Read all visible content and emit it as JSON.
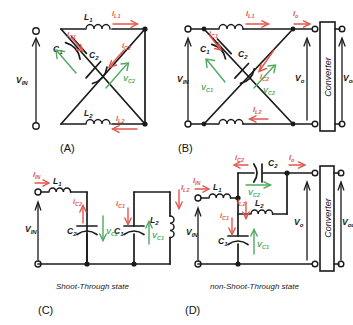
{
  "figure": {
    "panels": [
      {
        "id": "A",
        "label": "(A)",
        "source_label": "V",
        "source_sub": "IN",
        "components": [
          {
            "name": "L1",
            "base": "L",
            "sub": "1"
          },
          {
            "name": "L2",
            "base": "L",
            "sub": "2"
          },
          {
            "name": "C1",
            "base": "C",
            "sub": "1"
          },
          {
            "name": "C2",
            "base": "C",
            "sub": "2"
          }
        ],
        "currents": [
          {
            "base": "I",
            "sub": "L1"
          },
          {
            "base": "I",
            "sub": "L2"
          },
          {
            "base": "i",
            "sub": "C1"
          },
          {
            "base": "i",
            "sub": "C2"
          }
        ],
        "voltages": [
          {
            "base": "V",
            "sub": "C2"
          }
        ]
      },
      {
        "id": "B",
        "label": "(B)",
        "source_label": "V",
        "source_sub": "IN",
        "converter_label": "Converter",
        "components": [
          {
            "name": "L1",
            "base": "L",
            "sub": "1"
          },
          {
            "name": "L2",
            "base": "L",
            "sub": "2"
          },
          {
            "name": "C1",
            "base": "C",
            "sub": "1"
          },
          {
            "name": "C2",
            "base": "C",
            "sub": "2"
          }
        ],
        "currents": [
          {
            "base": "I",
            "sub": "L1"
          },
          {
            "base": "I",
            "sub": "L2"
          },
          {
            "base": "i",
            "sub": "C1"
          },
          {
            "base": "i",
            "sub": "C2"
          },
          {
            "base": "I",
            "sub": "o"
          }
        ],
        "voltages": [
          {
            "base": "V",
            "sub": "C1"
          },
          {
            "base": "V",
            "sub": "C2"
          },
          {
            "base": "V",
            "sub": "o"
          },
          {
            "base": "V",
            "sub": "out"
          }
        ]
      },
      {
        "id": "C",
        "label": "(C)",
        "state": "Shoot-Through state",
        "source_label": "V",
        "source_sub": "IN",
        "components": [
          {
            "name": "L1",
            "base": "L",
            "sub": "1"
          },
          {
            "name": "L2",
            "base": "L",
            "sub": "2"
          },
          {
            "name": "C1",
            "base": "C",
            "sub": "1"
          },
          {
            "name": "C2",
            "base": "C",
            "sub": "2"
          }
        ],
        "currents": [
          {
            "base": "I",
            "sub": "IN"
          },
          {
            "base": "I",
            "sub": "L2"
          },
          {
            "base": "i",
            "sub": "C1"
          },
          {
            "base": "i",
            "sub": "C2"
          }
        ],
        "voltages": [
          {
            "base": "V",
            "sub": "C1"
          },
          {
            "base": "V",
            "sub": "C2"
          }
        ]
      },
      {
        "id": "D",
        "label": "(D)",
        "state": "non-Shoot-Through state",
        "source_label": "V",
        "source_sub": "IN",
        "converter_label": "Converter",
        "components": [
          {
            "name": "L1",
            "base": "L",
            "sub": "1"
          },
          {
            "name": "L2",
            "base": "L",
            "sub": "2"
          },
          {
            "name": "C1",
            "base": "C",
            "sub": "1"
          },
          {
            "name": "C2",
            "base": "C",
            "sub": "2"
          }
        ],
        "currents": [
          {
            "base": "I",
            "sub": "IN"
          },
          {
            "base": "I",
            "sub": "L2"
          },
          {
            "base": "i",
            "sub": "C1"
          },
          {
            "base": "i",
            "sub": "C2"
          },
          {
            "base": "I",
            "sub": "o"
          }
        ],
        "voltages": [
          {
            "base": "V",
            "sub": "C1"
          },
          {
            "base": "V",
            "sub": "C2"
          },
          {
            "base": "V",
            "sub": "o"
          },
          {
            "base": "V",
            "sub": "out"
          }
        ]
      }
    ],
    "colors": {
      "wire": "#1a1a1a",
      "current_arrow": "#e2574c",
      "voltage_arrow": "#4ea961",
      "background": "#ffffff"
    }
  },
  "labels": {
    "panelA": "(A)",
    "panelB": "(B)",
    "panelC": "(C)",
    "panelD": "(D)",
    "stateC": "Shoot-Through state",
    "stateD": "non-Shoot-Through state",
    "converter": "Converter",
    "V": "V",
    "I": "I",
    "i": "i",
    "L": "L",
    "C": "C",
    "sub_IN": "IN",
    "sub_1": "1",
    "sub_2": "2",
    "sub_L1": "L1",
    "sub_L2": "L2",
    "sub_C1": "C1",
    "sub_C2": "C2",
    "sub_o": "o",
    "sub_out": "out"
  }
}
